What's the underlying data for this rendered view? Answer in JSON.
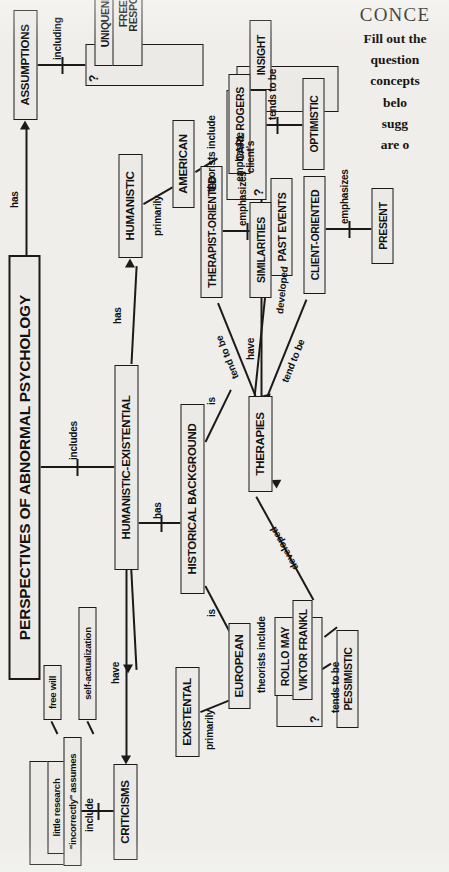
{
  "page": {
    "background_color": "#efeeea",
    "ink_color": "#1a1a1a",
    "orientation": "rotated-90-ccw"
  },
  "instructions": {
    "heading": "CONCE",
    "lines": [
      "Fill out the",
      "question",
      "concepts",
      "belo",
      "sugg",
      "are o"
    ]
  },
  "concept_map": {
    "title": "PERSPECTIVES OF ABNORMAL PSYCHOLOGY",
    "nodes": {
      "humanistic_existential": "HUMANISTIC-EXISTENTIAL",
      "criticisms": "CRITICISMS",
      "little_research": "little research",
      "incorrectly_assumes": "\"incorrectly\" assumes",
      "free_will": "free will",
      "self_actualization": "self-actualization",
      "existential": "EXISTENTAL",
      "european": "EUROPEAN",
      "rollo_may": "ROLLO MAY",
      "viktor_frankl": "VIKTOR FRANKL",
      "pessimistic": "PESSIMISTIC",
      "historical_background": "HISTORICAL BACKGROUND",
      "therapies": "THERAPIES",
      "therapist_oriented": "THERAPIST-ORIENTED",
      "past_events": "PAST EVENTS",
      "similarities": "SIMILARITIES",
      "insight": "INSIGHT",
      "client_oriented": "CLIENT-ORIENTED",
      "present": "PRESENT",
      "humanistic": "HUMANISTIC",
      "american": "AMERICAN",
      "carl_rogers": "CARL ROGERS",
      "optimistic": "OPTIMISTIC",
      "assumptions": "ASSUMPTIONS",
      "uniqueness": "UNIQUENESS",
      "freedom_and_responsibility": "FREEDOM AND RESPONSIBILITY"
    },
    "blank_boxes": {
      "criticisms_blank": "?",
      "frankl_blank": "?",
      "insight_blank": "?",
      "assumptions_blank": "?",
      "rogers_blank": "?"
    },
    "links": {
      "includes": "includes",
      "have": "have",
      "include": "include",
      "primarily_eu": "primarily",
      "theorists_include_eu": "theorists include",
      "tends_to_be_frankl": "tends to be",
      "has_historical": "has",
      "is_european": "is",
      "is_american": "is",
      "developed_existential": "developed",
      "tend_to_be_therapist": "tend to be",
      "emphasizes_past": "emphasizes",
      "have_similarities": "have",
      "emphasize_clients": "emphasize\nclient's",
      "tend_to_be_client": "tend to be",
      "emphasizes_present": "emphasizes",
      "developed_humanistic": "developed",
      "primarily_am": "primarily",
      "theorists_include_am": "theorists include",
      "tends_to_be_rogers": "tends to be",
      "has_humanistic": "has",
      "has_assumptions": "has",
      "including": "including"
    }
  }
}
